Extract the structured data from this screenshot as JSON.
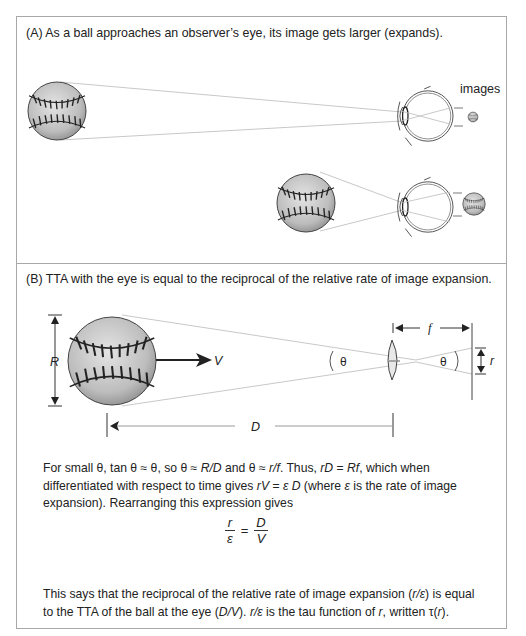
{
  "panel_a": {
    "caption": "(A) As a ball approaches an observer’s eye, its image gets larger (expands).",
    "images_label": "images"
  },
  "panel_b": {
    "caption": "(B) TTA with the eye is equal to the reciprocal of the relative rate of image expansion.",
    "labels": {
      "R": "R",
      "V": "V",
      "D": "D",
      "f": "f",
      "r": "r",
      "theta_left": "θ",
      "theta_right": "θ"
    },
    "paragraph1": {
      "parts": [
        "For small θ, tan θ ≈ θ, so θ ≈ ",
        "R/D",
        " and θ ≈ ",
        "r/f",
        ". Thus, ",
        "rD",
        " = ",
        "Rf",
        ", which when differentiated with respect to time gives ",
        "rV",
        " = ",
        "ε D",
        " (where ",
        "ε",
        " is the rate of image expansion). Rearranging this expression gives"
      ]
    },
    "equation": {
      "lhs_num": "r",
      "lhs_den": "ε",
      "eq": "=",
      "rhs_num": "D",
      "rhs_den": "V"
    },
    "paragraph2": {
      "parts": [
        "This says that the reciprocal of the relative rate of image expansion (",
        "r/ε",
        ") is equal to the TTA of the ball at the eye (",
        "D/V",
        "). ",
        "r/ε",
        " is the tau function of ",
        "r",
        ", written τ(",
        "r",
        ")."
      ]
    }
  }
}
